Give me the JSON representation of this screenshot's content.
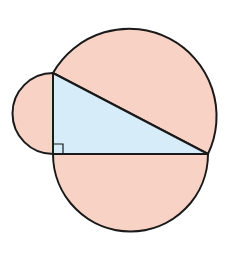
{
  "diagram": {
    "colors": {
      "semicircle_fill": "#f8d3c5",
      "triangle_fill": "#d6ecf8",
      "stroke": "#1a1a1a",
      "background": "#ffffff"
    },
    "triangle": {
      "vertices": {
        "top": [
          53,
          73
        ],
        "right_angle": [
          53,
          154
        ],
        "right": [
          208,
          154
        ]
      },
      "right_angle_marker": true
    },
    "semicircles": [
      {
        "name": "hypotenuse",
        "side": "hypotenuse",
        "direction": "outward"
      },
      {
        "name": "vertical-leg",
        "side": "left leg",
        "direction": "left"
      },
      {
        "name": "horizontal-leg",
        "side": "bottom leg",
        "direction": "down"
      }
    ]
  }
}
